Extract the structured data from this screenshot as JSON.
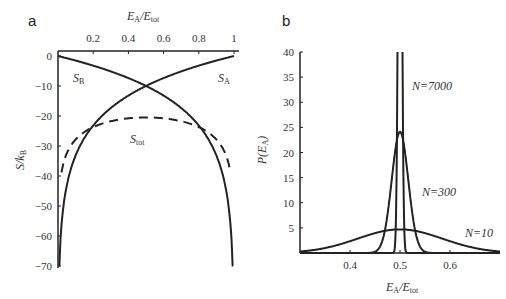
{
  "chart_data": [
    {
      "panel": "a",
      "type": "line",
      "title": "",
      "xlabel": "E_A/E_tot",
      "ylabel": "S/k_B",
      "xlim": [
        0,
        1
      ],
      "ylim": [
        -70,
        0
      ],
      "xticks": [
        0.2,
        0.4,
        0.6,
        0.8,
        1
      ],
      "xtick_labels": [
        "0.2",
        "0.4",
        "0.6",
        "0.8",
        "1"
      ],
      "yticks": [
        0,
        -10,
        -20,
        -30,
        -40,
        -50,
        -60,
        -70
      ],
      "ytick_labels": [
        "0",
        "−10",
        "−20",
        "−30",
        "−40",
        "−50",
        "−60",
        "−70"
      ],
      "x_axis_position": "top",
      "grid": false,
      "series": [
        {
          "name": "S_A",
          "style": "solid",
          "x": [
            0.005,
            0.05,
            0.1,
            0.2,
            0.3,
            0.4,
            0.5,
            0.6,
            0.7,
            0.8,
            0.9,
            1.0
          ],
          "y": [
            -70,
            -40,
            -31,
            -22,
            -17,
            -13.5,
            -10,
            -7.5,
            -5.2,
            -3.2,
            -1.5,
            0
          ]
        },
        {
          "name": "S_B",
          "style": "solid",
          "x": [
            0.0,
            0.1,
            0.2,
            0.3,
            0.4,
            0.5,
            0.6,
            0.7,
            0.8,
            0.9,
            0.95,
            0.995
          ],
          "y": [
            0,
            -1.5,
            -3.2,
            -5.2,
            -7.5,
            -10,
            -13.5,
            -17,
            -22,
            -31,
            -40,
            -70
          ]
        },
        {
          "name": "S_tot",
          "style": "dashed",
          "x": [
            0.02,
            0.05,
            0.1,
            0.2,
            0.3,
            0.4,
            0.5,
            0.6,
            0.7,
            0.8,
            0.9,
            0.95,
            0.98
          ],
          "y": [
            -45,
            -36,
            -30,
            -25,
            -22,
            -21,
            -20.5,
            -21,
            -22,
            -25,
            -30,
            -36,
            -45
          ]
        }
      ],
      "annotations": [
        "S_B",
        "S_A",
        "S_tot"
      ]
    },
    {
      "panel": "b",
      "type": "line",
      "title": "",
      "xlabel": "E_A/E_tot",
      "ylabel": "P(E_A)",
      "xlim": [
        0.3,
        0.7
      ],
      "ylim": [
        0,
        40
      ],
      "xticks": [
        0.4,
        0.5,
        0.6
      ],
      "xtick_labels": [
        "0.4",
        "0.5",
        "0.6"
      ],
      "yticks": [
        5,
        10,
        15,
        20,
        25,
        30,
        35,
        40
      ],
      "ytick_labels": [
        "5",
        "10",
        "15",
        "20",
        "25",
        "30",
        "35",
        "40"
      ],
      "grid": false,
      "series": [
        {
          "name": "N=10",
          "mean": 0.5,
          "sigma": 0.085,
          "peak": 4.7
        },
        {
          "name": "N=300",
          "mean": 0.5,
          "sigma": 0.0165,
          "peak": 24.1
        },
        {
          "name": "N=7000",
          "mean": 0.5,
          "sigma": 0.0034,
          "peak": 117
        }
      ],
      "annotations": [
        "N=7000",
        "N=300",
        "N=10"
      ]
    }
  ],
  "labels": {
    "panel_a": "a",
    "panel_b": "b",
    "a_xlabel_main": "E",
    "a_xlabel_sub": "A",
    "a_xlabel_div": "/E",
    "a_xlabel_sub2": "tot",
    "a_ylabel_main": "S/k",
    "a_ylabel_sub": "B",
    "b_ylabel": "P(E",
    "b_ylabel_sub": "A",
    "b_ylabel_end": ")",
    "s_a": "S",
    "s_a_sub": "A",
    "s_b": "S",
    "s_b_sub": "B",
    "s_tot": "S",
    "s_tot_sub": "tot",
    "n7000": "N=7000",
    "n300": "N=300",
    "n10": "N=10"
  }
}
